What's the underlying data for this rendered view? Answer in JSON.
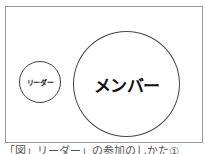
{
  "diagram": {
    "leader_circle": {
      "label": "リーダー"
    },
    "member_circle": {
      "label": "メンバー"
    },
    "caption": "「図」リーダー」の参加のしかた①"
  }
}
